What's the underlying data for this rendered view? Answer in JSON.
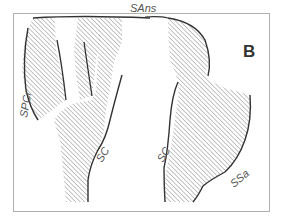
{
  "figure": {
    "panel_label": "B",
    "labels": {
      "sans": "SAns",
      "spcr": "SPCr",
      "sc_left": "SC",
      "sc_right": "SC",
      "ssa": "SSa"
    },
    "colors": {
      "frame": "#b0b0b0",
      "outline": "#333333",
      "hatch": "#8a8a8a",
      "label": "#555555"
    }
  }
}
